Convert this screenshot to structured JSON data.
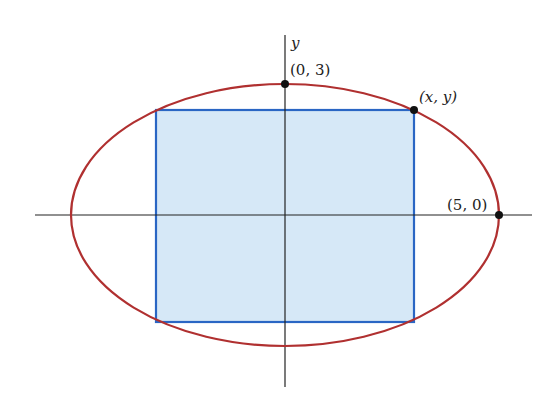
{
  "figure": {
    "axes": {
      "y_label": "y",
      "x_label": ""
    },
    "ellipse": {
      "semi_major": 5,
      "semi_minor": 3,
      "color": "#b03030"
    },
    "rectangle": {
      "fill": "#d6e8f7",
      "stroke": "#2a66c4"
    },
    "points": [
      {
        "id": "top-vertex",
        "label": "(0, 3)"
      },
      {
        "id": "corner-point",
        "label": "(x, y)"
      },
      {
        "id": "right-vertex",
        "label": "(5, 0)"
      }
    ],
    "colors": {
      "axis": "#222222",
      "point": "#111111"
    }
  }
}
